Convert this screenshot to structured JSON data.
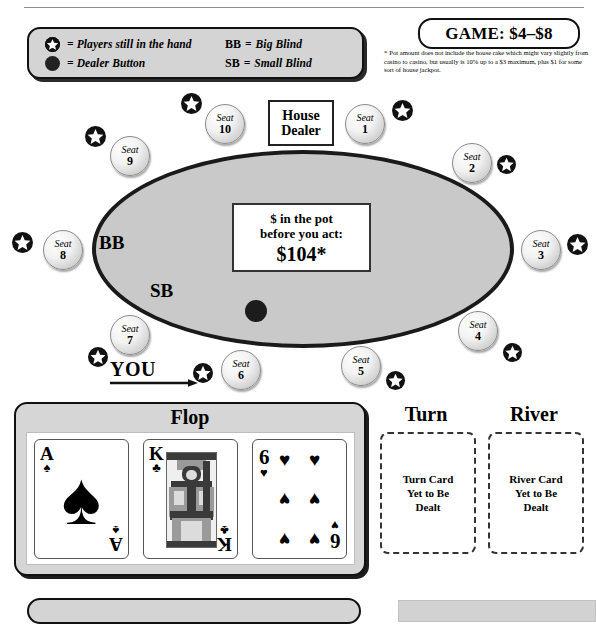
{
  "legend": {
    "star_label": "= Players still in the hand",
    "dot_label": "= Dealer Button",
    "bb_abbr": "BB",
    "bb_eq": "=",
    "bb_label": "Big Blind",
    "sb_abbr": "SB",
    "sb_eq": "=",
    "sb_label": "Small Blind"
  },
  "game": {
    "badge": "GAME: $4–$8",
    "footnote_marker": "*",
    "footnote": "Pot amount does not include the house rake which might vary slightly from casino to casino, but usually is 10% up to a $3 maximum, plus $1 for some sort of house jackpot."
  },
  "table": {
    "house_dealer_line1": "House",
    "house_dealer_line2": "Dealer",
    "bb_marker": "BB",
    "sb_marker": "SB",
    "pot_line1": "$ in the pot",
    "pot_line2": "before you act:",
    "pot_amount": "$104*",
    "you_label": "YOU",
    "seat_word": "Seat",
    "seats": [
      {
        "number": "10",
        "word": "Seat",
        "x": 205,
        "y": 104,
        "star_x": 181,
        "star_y": 93,
        "star_size": 21
      },
      {
        "number": "1",
        "word": "Seat",
        "x": 345,
        "y": 104,
        "star_x": 392,
        "star_y": 100,
        "star_size": 21
      },
      {
        "number": "2",
        "word": "Seat",
        "x": 452,
        "y": 143,
        "star_x": 497,
        "star_y": 155,
        "star_size": 19
      },
      {
        "number": "3",
        "word": "Seat",
        "x": 521,
        "y": 230,
        "star_x": 567,
        "star_y": 234,
        "star_size": 21
      },
      {
        "number": "4",
        "word": "Seat",
        "x": 458,
        "y": 311,
        "star_x": 503,
        "star_y": 343,
        "star_size": 19
      },
      {
        "number": "5",
        "word": "Seat",
        "x": 341,
        "y": 346,
        "star_x": 386,
        "star_y": 371,
        "star_size": 19
      },
      {
        "number": "6",
        "word": "Seat",
        "x": 221,
        "y": 350,
        "star_x": 193,
        "star_y": 363,
        "star_size": 20
      },
      {
        "number": "7",
        "word": "Seat",
        "x": 110,
        "y": 315,
        "star_x": 88,
        "star_y": 347,
        "star_size": 20
      },
      {
        "number": "8",
        "word": "Seat",
        "x": 43,
        "y": 230,
        "star_x": 12,
        "star_y": 232,
        "star_size": 21
      },
      {
        "number": "9",
        "word": "Seat",
        "x": 110,
        "y": 136,
        "star_x": 85,
        "star_y": 126,
        "star_size": 21
      }
    ]
  },
  "board": {
    "flop_title": "Flop",
    "cards": [
      {
        "rank": "A",
        "suit": "♠",
        "name": "ace-of-spades"
      },
      {
        "rank": "K",
        "suit": "♣",
        "name": "king-of-clubs"
      },
      {
        "rank": "6",
        "suit": "♥",
        "name": "six-of-hearts"
      }
    ],
    "turn_title": "Turn",
    "turn_placeholder": "Turn Card\nYet to Be\nDealt",
    "turn_placeholder_lines": [
      "Turn Card",
      "Yet to Be",
      "Dealt"
    ],
    "river_title": "River",
    "river_placeholder_lines": [
      "River Card",
      "Yet to Be",
      "Dealt"
    ]
  },
  "colors": {
    "felt": "#c9c9c9",
    "panel": "#d4d4d4",
    "ink": "#111111",
    "card_face": "#ffffff"
  }
}
